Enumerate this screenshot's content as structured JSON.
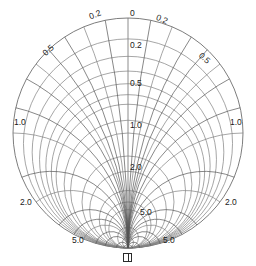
{
  "chart_data": {
    "type": "line",
    "title": "",
    "subtitle": "",
    "xlabel": "",
    "ylabel": "",
    "chart_kind": "smith-chart",
    "orientation": "rotated-90-origin-bottom",
    "background_color": "#ffffff",
    "line_color": "#808080",
    "label_color": "#1a1a1a",
    "geometry": {
      "center_x": 128,
      "center_y": 133,
      "radius": 115,
      "origin_x": 128,
      "origin_y": 248,
      "open_x": 128,
      "open_y": 18
    },
    "resistance_circles": [
      0.2,
      0.5,
      1.0,
      2.0,
      5.0
    ],
    "reactance_arcs": [
      0.2,
      0.5,
      1.0,
      2.0,
      5.0
    ],
    "axis_ticks": [
      "0",
      "0.2",
      "0.5",
      "1.0",
      "2.0",
      "5.0"
    ],
    "origin_symbol": "infinity",
    "grid": true,
    "legend": "none"
  },
  "labels": {
    "center_axis": [
      {
        "text": "0",
        "x": 130,
        "y": 9,
        "name": "axis-label-0"
      },
      {
        "text": "0.2",
        "x": 130,
        "y": 41,
        "name": "axis-label-0-2"
      },
      {
        "text": "0.5",
        "x": 130,
        "y": 79,
        "name": "axis-label-0-5"
      },
      {
        "text": "1.0",
        "x": 130,
        "y": 121,
        "name": "axis-label-1-0"
      },
      {
        "text": "2.0",
        "x": 130,
        "y": 163,
        "name": "axis-label-2-0"
      },
      {
        "text": "5.0",
        "x": 140,
        "y": 208,
        "name": "axis-label-5-0"
      }
    ],
    "left_side": [
      {
        "text": "0.2",
        "x": 88,
        "y": 13,
        "rot": -22,
        "name": "left-label-0-2"
      },
      {
        "text": "0.5",
        "x": 41,
        "y": 51,
        "rot": -42,
        "name": "left-label-0-5"
      },
      {
        "text": "1.0",
        "x": 14,
        "y": 118,
        "rot": 0,
        "name": "left-label-1-0"
      },
      {
        "text": "2.0",
        "x": 20,
        "y": 198,
        "rot": 0,
        "name": "left-label-2-0"
      },
      {
        "text": "5.0",
        "x": 72,
        "y": 236,
        "rot": 0,
        "name": "left-label-5-0"
      }
    ],
    "right_side": [
      {
        "text": "0.2",
        "x": 158,
        "y": 13,
        "rot": 22,
        "name": "right-label-0-2"
      },
      {
        "text": "0.5",
        "x": 203,
        "y": 51,
        "rot": 42,
        "name": "right-label-0-5"
      },
      {
        "text": "1.0",
        "x": 230,
        "y": 118,
        "rot": 0,
        "name": "right-label-1-0"
      },
      {
        "text": "2.0",
        "x": 225,
        "y": 198,
        "rot": 0,
        "name": "right-label-2-0"
      },
      {
        "text": "5.0",
        "x": 163,
        "y": 236,
        "rot": 0,
        "name": "right-label-5-0"
      }
    ],
    "origin": {
      "symbol": "∎",
      "x": 123,
      "y": 253,
      "name": "origin-infinity-marker"
    }
  }
}
